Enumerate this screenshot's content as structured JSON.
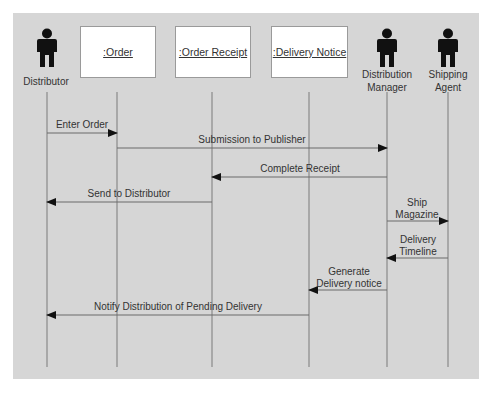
{
  "diagram": {
    "type": "uml-sequence",
    "colors": {
      "panel": "#d6d6d6",
      "box": "#ffffff",
      "line": "#6e6e6e",
      "actor": "#111111",
      "text": "#333333"
    },
    "participants": [
      {
        "id": "distributor",
        "kind": "actor",
        "label": "Distributor",
        "x": 47
      },
      {
        "id": "order",
        "kind": "object",
        "label": ":Order",
        "x": 117,
        "box_left": 80,
        "box_width": 76
      },
      {
        "id": "order_receipt",
        "kind": "object",
        "label": ":Order Receipt",
        "x": 212,
        "box_left": 175,
        "box_width": 76
      },
      {
        "id": "delivery_notice",
        "kind": "object",
        "label": ":Delivery Notice",
        "x": 309,
        "box_left": 271,
        "box_width": 77
      },
      {
        "id": "distribution_manager",
        "kind": "actor",
        "label_line1": "Distribution",
        "label_line2": "Manager",
        "x": 387
      },
      {
        "id": "shipping_agent",
        "kind": "actor",
        "label_line1": "Shipping",
        "label_line2": "Agent",
        "x": 448
      }
    ],
    "messages": [
      {
        "label": "Enter Order",
        "from": "distributor",
        "to": "order",
        "y": 133
      },
      {
        "label": "Submission to Publisher",
        "from": "order",
        "to": "distribution_manager",
        "y": 148
      },
      {
        "label": "Complete Receipt",
        "from": "distribution_manager",
        "to": "order_receipt",
        "y": 177
      },
      {
        "label": "Send to Distributor",
        "from": "order_receipt",
        "to": "distributor",
        "y": 202
      },
      {
        "label_line1": "Ship",
        "label_line2": "Magazine",
        "from": "distribution_manager",
        "to": "shipping_agent",
        "y": 221
      },
      {
        "label_line1": "Delivery",
        "label_line2": "Timeline",
        "from": "shipping_agent",
        "to": "distribution_manager",
        "y": 258
      },
      {
        "label_line1": "Generate",
        "label_line2": "Delivery notice",
        "from": "distribution_manager",
        "to": "delivery_notice",
        "y": 290
      },
      {
        "label": "Notify Distribution of Pending Delivery",
        "from": "delivery_notice",
        "to": "distributor",
        "y": 315
      }
    ]
  }
}
